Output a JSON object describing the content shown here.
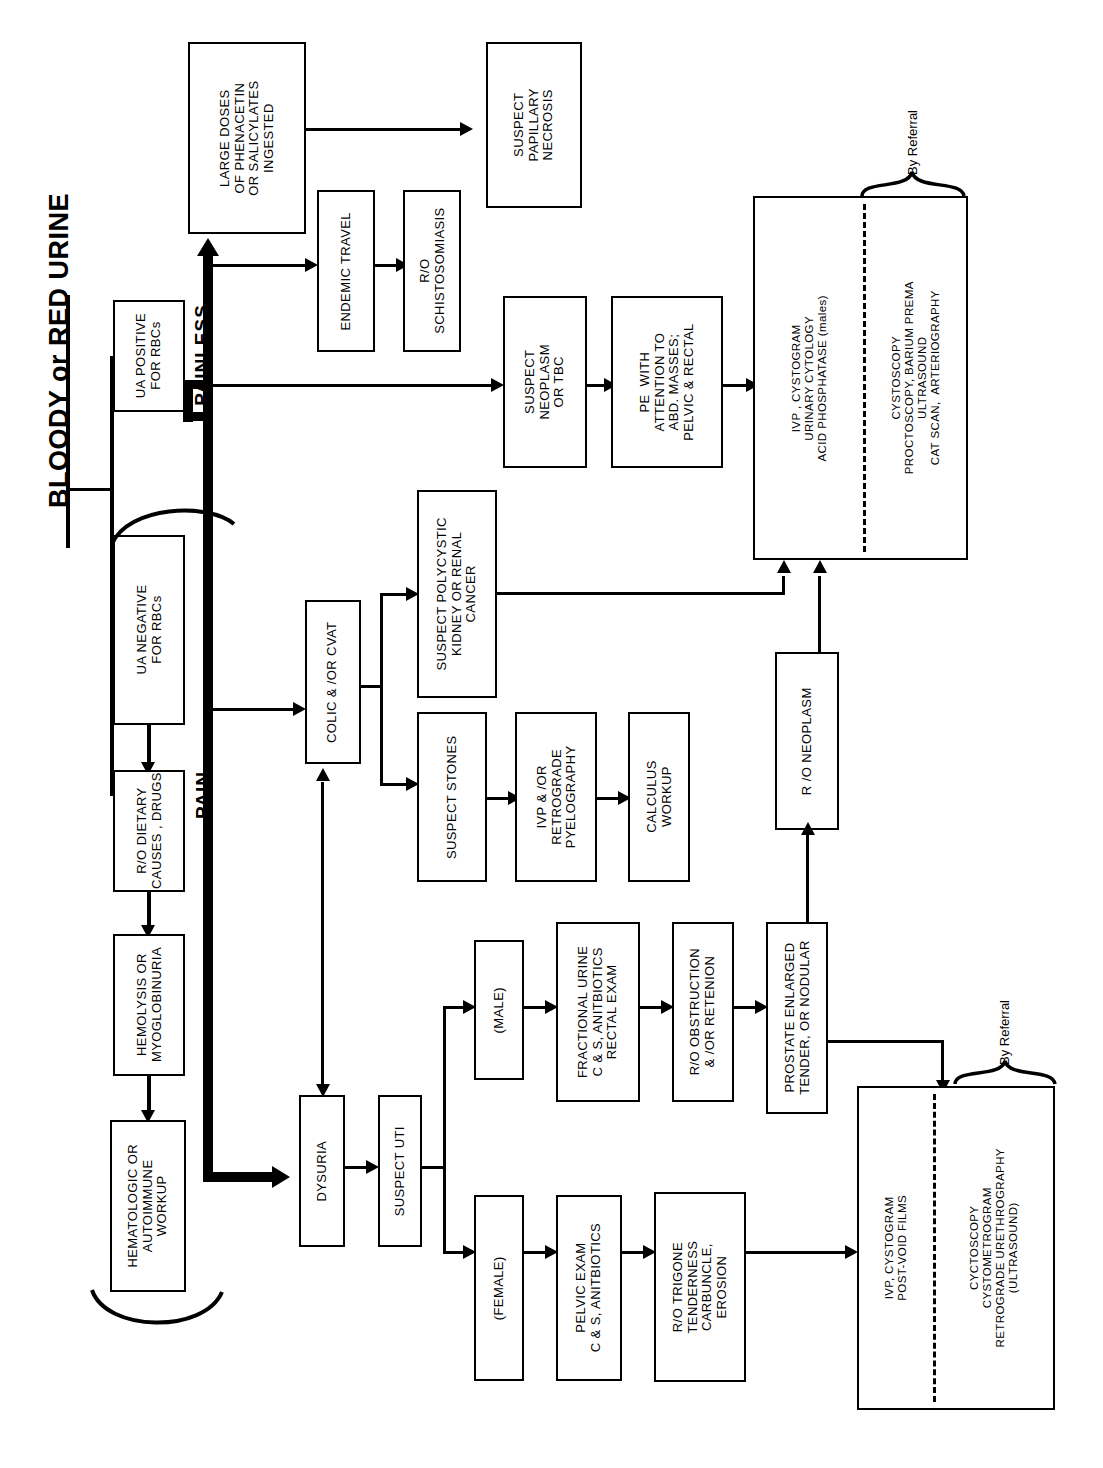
{
  "title": "BLOODY or RED URINE",
  "branch_labels": {
    "painless": "PAINLESS",
    "pain": "PAIN"
  },
  "referral_labels": {
    "top": "By Referral",
    "bottom": "By Referral"
  },
  "nodes": {
    "ua_positive": "UA POSITIVE\nFOR RBCs",
    "ua_negative": "UA NEGATIVE\nFOR RBCs",
    "ro_dietary": "R/O DIETARY\nCAUSES , DRUGS",
    "hemolysis": "HEMOLYSIS OR\nMYOGLOBINURIA",
    "hematologic": "HEMATOLOGIC OR\nAUTOIMMUNE\nWORKUP",
    "large_doses": "LARGE DOSES\nOF PHENACETIN\nOR SALICYLATES\nINGESTED",
    "papillary": "SUSPECT\nPAPILLARY\nNECROSIS",
    "endemic_travel": "ENDEMIC TRAVEL",
    "schistosomiasis": "R/O\nSCHISTOSOMIASIS",
    "neoplasm_tbc": "SUSPECT\nNEOPLASM\nOR TBC",
    "pe_with": "PE  WITH\nATTENTION TO\nABD. MASSES;\nPELVIC & RECTAL",
    "ivp_main_left": "IVP , CYSTOGRAM\nURINARY CYTOLOGY\nACID PHOSPHATASE (males)",
    "ivp_main_right": "CYSTOSCOPY\nPROCTOSCOPY, BARIUM PREMA\nULTRASOUND\nCAT SCAN,  ARTERIOGRAPHY",
    "colic_cvat": "COLIC & /OR CVAT",
    "polycystic": "SUSPECT POLYCYSTIC\nKIDNEY OR RENAL\nCANCER",
    "suspect_stones": "SUSPECT STONES",
    "ivp_retrograde": "IVP & /OR\nRETROGRADE\nPYELOGRAPHY",
    "calculus": "CALCULUS\nWORKUP",
    "ro_neoplasm": "R /O NEOPLASM",
    "dysuria": "DYSURIA",
    "suspect_uti": "SUSPECT UTI",
    "male": "(MALE)",
    "fractional_urine": "FRACTIONAL URINE\nC & S, ANITBIOTICS\nRECTAL EXAM",
    "ro_obstruction": "R/O OBSTRUCTION\n& /OR RETENION",
    "prostate": "PROSTATE ENLARGED\nTENDER, OR NODULAR",
    "female": "(FEMALE)",
    "pelvic_exam": "PELVIC EXAM\nC & S, ANITBIOTICS",
    "ro_trigone": "R/O TRIGONE\nTENDERNESS\nCARBUNCLE,\nEROSION",
    "ivp_bottom_left": "IVP, CYSTOGRAM\nPOST-VOID FILMS",
    "ivp_bottom_right": "CYCTOSCOPY\nCYSTOMETROGRAM\nRETROGRADE URETHROGRAPHY\n(ULTRASOUND)"
  },
  "colors": {
    "ink": "#000000",
    "paper": "#ffffff"
  }
}
